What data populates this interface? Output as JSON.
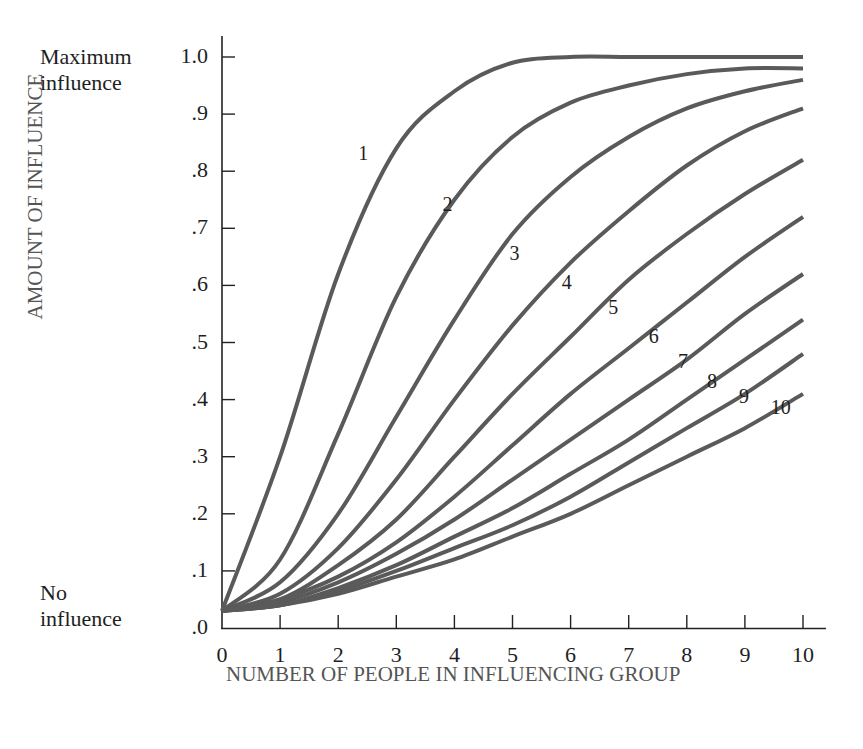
{
  "chart_data": {
    "type": "line",
    "title": "",
    "xlabel": "NUMBER OF PEOPLE IN INFLUENCING GROUP",
    "ylabel": "AMOUNT OF INFLUENCE",
    "x": [
      0,
      1,
      2,
      3,
      4,
      5,
      6,
      7,
      8,
      9,
      10
    ],
    "xlim": [
      0,
      10
    ],
    "ylim": [
      0,
      1.0
    ],
    "x_tick_labels": [
      "0",
      "1",
      "2",
      "3",
      "4",
      "5",
      "6",
      "7",
      "8",
      "9",
      "10"
    ],
    "y_tick_labels": [
      ".0",
      ".1",
      ".2",
      ".3",
      ".4",
      ".5",
      ".6",
      ".7",
      ".8",
      ".9",
      "1.0"
    ],
    "y_annotations": {
      "top": [
        "Maximum",
        "influence"
      ],
      "bottom": [
        "No",
        "influence"
      ]
    },
    "grid": false,
    "legend": "inline curve labels 1-10",
    "line_color": "#5a5a5a",
    "series": [
      {
        "name": "1",
        "values": [
          0.03,
          0.3,
          0.62,
          0.84,
          0.94,
          0.99,
          1.0,
          1.0,
          1.0,
          1.0,
          1.0
        ]
      },
      {
        "name": "2",
        "values": [
          0.03,
          0.12,
          0.34,
          0.58,
          0.75,
          0.86,
          0.92,
          0.95,
          0.97,
          0.98,
          0.98
        ]
      },
      {
        "name": "3",
        "values": [
          0.03,
          0.08,
          0.2,
          0.37,
          0.54,
          0.69,
          0.79,
          0.86,
          0.91,
          0.94,
          0.96
        ]
      },
      {
        "name": "4",
        "values": [
          0.03,
          0.06,
          0.14,
          0.26,
          0.4,
          0.53,
          0.64,
          0.73,
          0.81,
          0.87,
          0.91
        ]
      },
      {
        "name": "5",
        "values": [
          0.03,
          0.05,
          0.11,
          0.19,
          0.3,
          0.41,
          0.51,
          0.61,
          0.69,
          0.76,
          0.82
        ]
      },
      {
        "name": "6",
        "values": [
          0.03,
          0.05,
          0.09,
          0.15,
          0.23,
          0.32,
          0.41,
          0.49,
          0.57,
          0.65,
          0.72
        ]
      },
      {
        "name": "7",
        "values": [
          0.03,
          0.045,
          0.08,
          0.13,
          0.19,
          0.26,
          0.33,
          0.4,
          0.47,
          0.55,
          0.62
        ]
      },
      {
        "name": "8",
        "values": [
          0.03,
          0.04,
          0.07,
          0.11,
          0.16,
          0.21,
          0.27,
          0.33,
          0.4,
          0.47,
          0.54
        ]
      },
      {
        "name": "9",
        "values": [
          0.03,
          0.04,
          0.065,
          0.1,
          0.14,
          0.18,
          0.23,
          0.29,
          0.35,
          0.41,
          0.48
        ]
      },
      {
        "name": "10",
        "values": [
          0.03,
          0.04,
          0.06,
          0.09,
          0.12,
          0.16,
          0.2,
          0.25,
          0.3,
          0.35,
          0.41
        ]
      }
    ],
    "curve_label_positions": [
      {
        "name": "1",
        "x": 2.45,
        "y": 0.83
      },
      {
        "name": "2",
        "x": 3.9,
        "y": 0.74
      },
      {
        "name": "3",
        "x": 5.05,
        "y": 0.655
      },
      {
        "name": "4",
        "x": 5.95,
        "y": 0.605
      },
      {
        "name": "5",
        "x": 6.75,
        "y": 0.56
      },
      {
        "name": "6",
        "x": 7.45,
        "y": 0.51
      },
      {
        "name": "7",
        "x": 7.95,
        "y": 0.465
      },
      {
        "name": "8",
        "x": 8.45,
        "y": 0.43
      },
      {
        "name": "9",
        "x": 9.0,
        "y": 0.405
      },
      {
        "name": "10",
        "x": 9.55,
        "y": 0.385
      }
    ]
  }
}
